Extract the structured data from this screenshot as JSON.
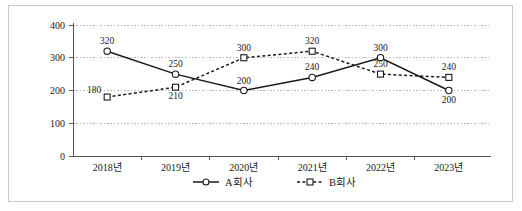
{
  "chart_data": {
    "type": "line",
    "title": "",
    "subtitle": "",
    "xlabel": "",
    "ylabel": "",
    "categories": [
      "2018년",
      "2019년",
      "2020년",
      "2021년",
      "2022년",
      "2023년"
    ],
    "yticks": [
      "0",
      "100",
      "200",
      "300",
      "400"
    ],
    "ytick_values": [
      0,
      100,
      200,
      300,
      400
    ],
    "ylim": [
      0,
      400
    ],
    "grid": true,
    "grid_style": "dotted-horizontal",
    "legend_position": "bottom-center",
    "series": [
      {
        "name": "A회사",
        "values": [
          320,
          250,
          200,
          240,
          300,
          200
        ],
        "labels": [
          "320",
          "250",
          "200",
          "240",
          "300",
          "200"
        ],
        "line_style": "solid",
        "marker": "circle",
        "color": "#1a1a1a",
        "label_positions": [
          "above",
          "above",
          "above",
          "above",
          "above",
          "below"
        ]
      },
      {
        "name": "B회사",
        "values": [
          180,
          210,
          300,
          320,
          250,
          240
        ],
        "labels": [
          "180",
          "210",
          "300",
          "320",
          "250",
          "240"
        ],
        "line_style": "dotted",
        "marker": "square",
        "color": "#1a1a1a",
        "label_positions": [
          "left-above",
          "below",
          "above",
          "above",
          "above",
          "above"
        ]
      }
    ]
  },
  "legend": {
    "items": [
      {
        "label": "A회사",
        "marker": "circle",
        "line_style": "solid"
      },
      {
        "label": "B회사",
        "marker": "square",
        "line_style": "dotted"
      }
    ]
  },
  "colors": {
    "frame_border": "#c9c9c9",
    "axis": "#555555",
    "grid": "#b9b9b9",
    "series": "#1a1a1a",
    "background": "#ffffff"
  }
}
